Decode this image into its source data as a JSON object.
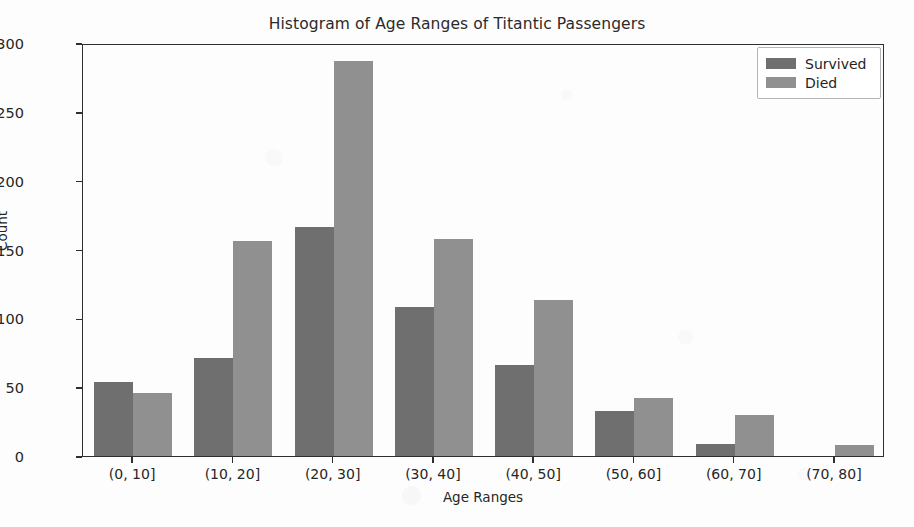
{
  "chart_data": {
    "type": "bar",
    "title": "Histogram of Age Ranges of Titantic Passengers",
    "xlabel": "Age Ranges",
    "ylabel": "Count",
    "categories": [
      "(0, 10]",
      "(10, 20]",
      "(20, 30]",
      "(30, 40]",
      "(40, 50]",
      "(50, 60]",
      "(60, 70]",
      "(70, 80]"
    ],
    "series": [
      {
        "name": "Survived",
        "color": "#6f6f6f",
        "values": [
          54,
          71,
          166,
          108,
          66,
          33,
          9,
          0
        ]
      },
      {
        "name": "Died",
        "color": "#909090",
        "values": [
          46,
          156,
          287,
          158,
          113,
          42,
          30,
          8
        ]
      }
    ],
    "ylim": [
      0,
      300
    ],
    "yticks": [
      0,
      50,
      100,
      150,
      200,
      250,
      300
    ],
    "ytick_labels": [
      "0",
      "50",
      "100",
      "150",
      "200",
      "250",
      "300"
    ],
    "grid": false,
    "legend_position": "upper right",
    "legend_entries": [
      "Survived",
      "Died"
    ]
  }
}
